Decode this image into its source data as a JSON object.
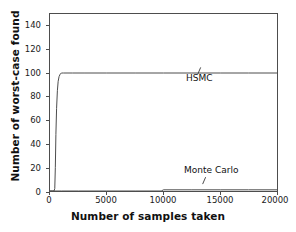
{
  "chart_data": {
    "type": "line",
    "title": "",
    "xlabel": "Number of samples taken",
    "ylabel": "Number of worst-case found",
    "xlim": [
      0,
      20000
    ],
    "ylim": [
      0,
      150
    ],
    "xticks": [
      0,
      5000,
      10000,
      15000,
      20000
    ],
    "xtick_labels": [
      "0",
      "5000",
      "10000",
      "15000",
      "20000"
    ],
    "yticks": [
      0,
      20,
      40,
      60,
      80,
      100,
      120,
      140
    ],
    "ytick_labels": [
      "0",
      "20",
      "40",
      "60",
      "80",
      "100",
      "120",
      "140"
    ],
    "grid": false,
    "legend": "none",
    "annotations": [
      {
        "text": "HSMC",
        "x": 13000,
        "y": 103
      },
      {
        "text": "Monte Carlo",
        "x": 13000,
        "y": 22
      }
    ],
    "series": [
      {
        "name": "HSMC",
        "color": "#4d4d4d",
        "x": [
          0,
          200,
          350,
          420,
          470,
          520,
          580,
          650,
          720,
          800,
          900,
          1000,
          1200,
          1500,
          2000,
          3000,
          5000,
          7500,
          10000,
          12500,
          15000,
          17500,
          20000
        ],
        "values": [
          0,
          0,
          0,
          2,
          20,
          48,
          70,
          85,
          93,
          97,
          99,
          100,
          100,
          100,
          100,
          100,
          100,
          100,
          100,
          100,
          100,
          100,
          100
        ]
      },
      {
        "name": "Monte Carlo",
        "color": "#4d4d4d",
        "x": [
          0,
          1000,
          2500,
          5000,
          7500,
          9800,
          10000,
          12500,
          15000,
          17500,
          20000
        ],
        "values": [
          0,
          0,
          0,
          0,
          0,
          0,
          1,
          1,
          1,
          1,
          1
        ]
      }
    ]
  }
}
